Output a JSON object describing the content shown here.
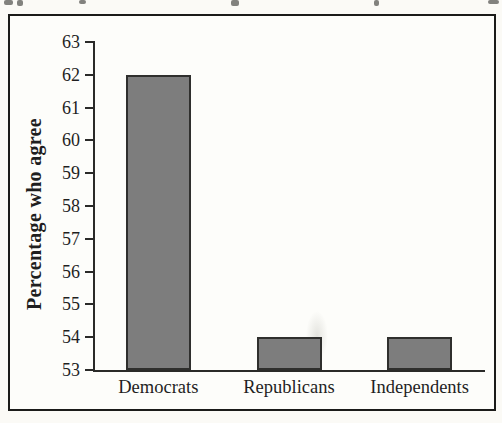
{
  "figure": {
    "ylabel": "Percentage who agree"
  },
  "chart_data": {
    "type": "bar",
    "categories": [
      "Democrats",
      "Republicans",
      "Independents"
    ],
    "values": [
      62,
      54,
      54
    ],
    "title": "",
    "xlabel": "",
    "ylabel": "Percentage who agree",
    "ylim": [
      53,
      63
    ],
    "yticks": [
      53,
      54,
      55,
      56,
      57,
      58,
      59,
      60,
      61,
      62,
      63
    ],
    "grid": false,
    "legend": false,
    "bar_color": "#7d7d7d",
    "bar_border_color": "#2f2f2d",
    "axis_color": "#2a2a28",
    "frame_color": "#1b1b19",
    "text_color": "#1f1f1f"
  }
}
